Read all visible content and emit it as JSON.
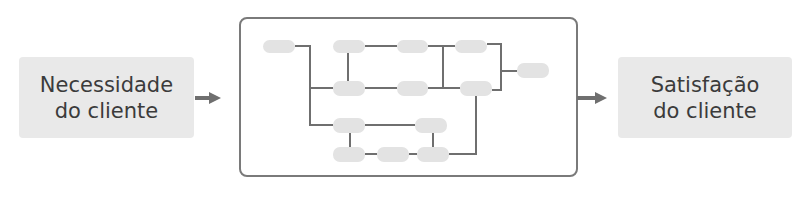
{
  "diagram": {
    "input": {
      "line1": "Necessidade",
      "line2": "do cliente"
    },
    "output": {
      "line1": "Satisfação",
      "line2": "do cliente"
    },
    "process_box": {
      "description": "Rede de processos internos (nós sem rótulo)",
      "node_count": 13
    },
    "colors": {
      "box_fill": "#e9e9e9",
      "node_fill": "#e3e3e3",
      "line": "#6f6f6f",
      "text": "#3b3b3b",
      "frame": "#7a7a7a"
    }
  }
}
